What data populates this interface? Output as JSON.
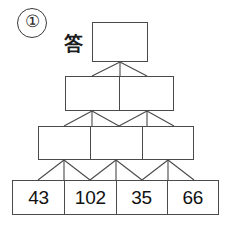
{
  "problem": {
    "number_label": "①",
    "answer_label": "答"
  },
  "pyramid": {
    "rows": [
      {
        "name": "row-top",
        "cells": [
          "",
          ""
        ]
      },
      {
        "name": "row-2",
        "cells": [
          "",
          ""
        ]
      },
      {
        "name": "row-3",
        "cells": [
          "",
          "",
          ""
        ]
      },
      {
        "name": "row-base",
        "cells": [
          "43",
          "102",
          "35",
          "66"
        ]
      }
    ],
    "top_cell": "",
    "row2_cells": [
      "",
      ""
    ],
    "row3_cells": [
      "",
      "",
      ""
    ],
    "base_cells": [
      "43",
      "102",
      "35",
      "66"
    ],
    "line_color": "#4a4a4a",
    "text_color": "#111111"
  }
}
